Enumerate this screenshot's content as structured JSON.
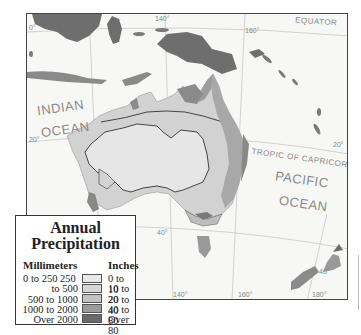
{
  "map": {
    "labels": {
      "indian_ocean_1": "INDIAN",
      "indian_ocean_2": "OCEAN",
      "pacific_ocean_1": "PACIFIC",
      "pacific_ocean_2": "OCEAN",
      "equator": "EQUATOR",
      "tropic": "TROPIC OF CAPRICORN"
    },
    "ticks": {
      "lat_0": "0°",
      "lat_20_left": "20°",
      "lat_20_right": "20°",
      "lat_40": "40°",
      "lat_40_right": "40°",
      "lon_140_top": "140°",
      "lon_160_top": "160°",
      "lon_120": "120°",
      "lon_140": "140°",
      "lon_160": "160°",
      "lon_180": "180°"
    },
    "colors": {
      "water": "#f7f7f5",
      "level1": "#e6e6e6",
      "level2": "#d2d2d2",
      "level3": "#bdbdbd",
      "level4": "#999999",
      "level5": "#6e6e6e"
    }
  },
  "legend": {
    "title_line1": "Annual",
    "title_line2": "Precipitation",
    "mm_header": "Millimeters",
    "in_header": "Inches",
    "rows": [
      {
        "mm": "0 to 250 250",
        "in": "0 to 10",
        "color": "#e8e8e8"
      },
      {
        "mm": "to 500",
        "in": "10 to 20",
        "color": "#d6d6d6"
      },
      {
        "mm": "500 to 1000",
        "in": "20 to 40",
        "color": "#c2c2c2"
      },
      {
        "mm": "1000 to 2000",
        "in": "40 to 80",
        "color": "#9c9c9c"
      },
      {
        "mm": "Over 2000",
        "in": "Over 80",
        "color": "#6a6a6a"
      }
    ]
  }
}
